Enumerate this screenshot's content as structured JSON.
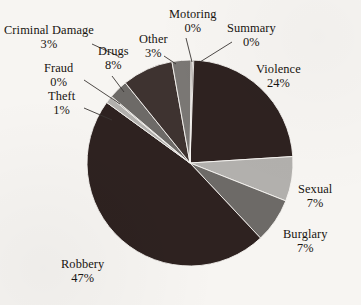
{
  "chart_data": {
    "type": "pie",
    "title": "",
    "xlabel": "",
    "ylabel": "",
    "legend_position": "outside-labels",
    "grid": false,
    "start_angle_deg": 0,
    "direction": "clockwise",
    "categories": [
      "Violence",
      "Sexual",
      "Burglary",
      "Robbery",
      "Theft",
      "Fraud",
      "Criminal Damage",
      "Drugs",
      "Other",
      "Motoring",
      "Summary"
    ],
    "values": [
      24,
      7,
      7,
      47,
      1,
      0,
      3,
      8,
      3,
      0,
      0
    ],
    "value_unit": "%",
    "slices": [
      {
        "label": "Violence",
        "value": 24,
        "display": "24%",
        "color": "#2e2220"
      },
      {
        "label": "Sexual",
        "value": 7,
        "display": "7%",
        "color": "#b2b0ad"
      },
      {
        "label": "Burglary",
        "value": 7,
        "display": "7%",
        "color": "#6d6a67"
      },
      {
        "label": "Robbery",
        "value": 47,
        "display": "47%",
        "color": "#2e2220"
      },
      {
        "label": "Theft",
        "value": 1,
        "display": "1%",
        "color": "#b2b0ad"
      },
      {
        "label": "Fraud",
        "value": 0,
        "display": "0%",
        "color": "#6d6a67"
      },
      {
        "label": "Criminal Damage",
        "value": 3,
        "display": "3%",
        "color": "#6d6a67"
      },
      {
        "label": "Drugs",
        "value": 8,
        "display": "8%",
        "color": "#3e3330"
      },
      {
        "label": "Other",
        "value": 3,
        "display": "3%",
        "color": "#7a7774"
      },
      {
        "label": "Motoring",
        "value": 0,
        "display": "0%",
        "color": "#2e2220"
      },
      {
        "label": "Summary",
        "value": 0,
        "display": "0%",
        "color": "#2e2220"
      }
    ]
  },
  "labels": {
    "violence": {
      "name": "Violence",
      "pct": "24%"
    },
    "sexual": {
      "name": "Sexual",
      "pct": "7%"
    },
    "burglary": {
      "name": "Burglary",
      "pct": "7%"
    },
    "robbery": {
      "name": "Robbery",
      "pct": "47%"
    },
    "theft": {
      "name": "Theft",
      "pct": "1%"
    },
    "fraud": {
      "name": "Fraud",
      "pct": "0%"
    },
    "criminal_damage": {
      "name": "Criminal Damage",
      "pct": "3%"
    },
    "drugs": {
      "name": "Drugs",
      "pct": "8%"
    },
    "other": {
      "name": "Other",
      "pct": "3%"
    },
    "motoring": {
      "name": "Motoring",
      "pct": "0%"
    },
    "summary": {
      "name": "Summary",
      "pct": "0%"
    }
  },
  "style": {
    "background": "#f7f5f2",
    "dark_slice": "#2e2220",
    "mid_slice": "#6d6a67",
    "light_slice": "#b2b0ad",
    "text": "#181410",
    "leader_line": "#3a3633"
  }
}
